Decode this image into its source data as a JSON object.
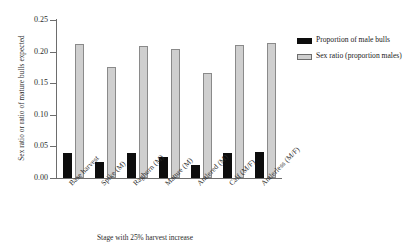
{
  "chart_data": {
    "type": "bar",
    "title": "",
    "xlabel": "Stage with 25% harvest increase",
    "ylabel": "Sex ratio or ratio of mature bulls expected",
    "categories": [
      "Base harvest",
      "Spike (M)",
      "Raghorn (M)",
      "Mature (M)",
      "Antlered (M)",
      "Calf (M/F)",
      "Antlerless (M/F)"
    ],
    "series": [
      {
        "name": "Proportion of male bulls",
        "color": "#0d0d0d",
        "values": [
          0.04,
          0.026,
          0.039,
          0.034,
          0.021,
          0.04,
          0.041
        ]
      },
      {
        "name": "Sex ratio (proportion males)",
        "color": "#cfcfcf",
        "values": [
          0.212,
          0.175,
          0.209,
          0.204,
          0.166,
          0.211,
          0.213
        ]
      }
    ],
    "ylim": [
      0.0,
      0.25
    ],
    "yticks": [
      "0.00",
      "0.05",
      "0.10",
      "0.15",
      "0.20",
      "0.25"
    ],
    "ytick_values": [
      0.0,
      0.05,
      0.1,
      0.15,
      0.2,
      0.25
    ],
    "grid": false,
    "legend_position": "right"
  },
  "legend": {
    "entries": [
      {
        "label": "Proportion of male bulls",
        "swatch": "black-swatch"
      },
      {
        "label": "Sex ratio (proportion males)",
        "swatch": "gray-swatch"
      }
    ]
  }
}
